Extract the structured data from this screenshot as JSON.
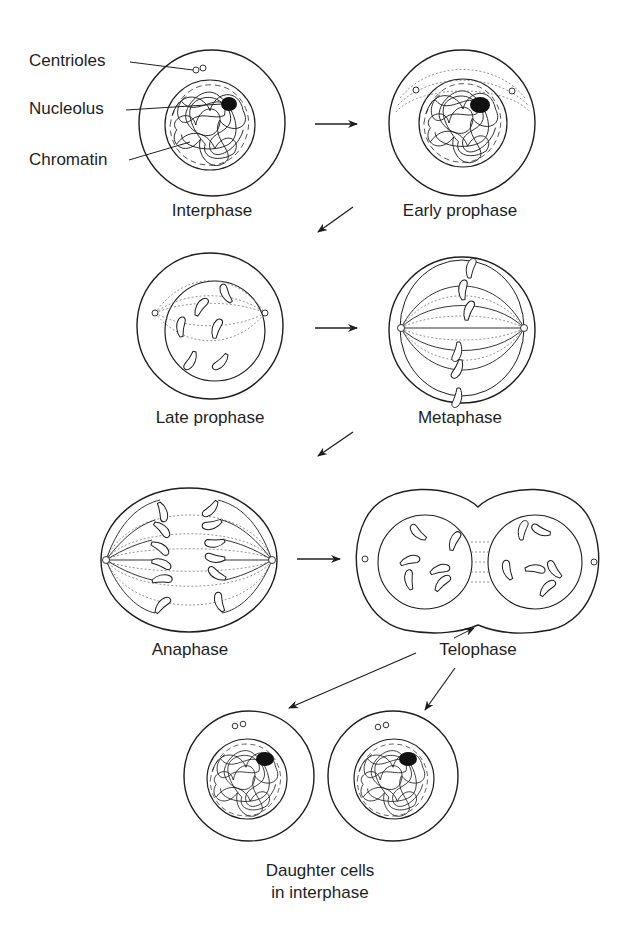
{
  "diagram": {
    "title": "",
    "stages": [
      {
        "id": "interphase",
        "label": "Interphase"
      },
      {
        "id": "early-prophase",
        "label": "Early prophase"
      },
      {
        "id": "late-prophase",
        "label": "Late prophase"
      },
      {
        "id": "metaphase",
        "label": "Metaphase"
      },
      {
        "id": "anaphase",
        "label": "Anaphase"
      },
      {
        "id": "telophase",
        "label": "Telophase"
      },
      {
        "id": "daughter-cells",
        "label_line1": "Daughter cells",
        "label_line2": "in interphase"
      }
    ],
    "callouts": [
      {
        "id": "centrioles",
        "label": "Centrioles"
      },
      {
        "id": "nucleolus",
        "label": "Nucleolus"
      },
      {
        "id": "chromatin",
        "label": "Chromatin"
      }
    ],
    "flow": [
      [
        "Interphase",
        "Early prophase"
      ],
      [
        "Early prophase",
        "Late prophase"
      ],
      [
        "Late prophase",
        "Metaphase"
      ],
      [
        "Metaphase",
        "Anaphase"
      ],
      [
        "Anaphase",
        "Telophase"
      ],
      [
        "Telophase",
        "Daughter cells in interphase"
      ]
    ],
    "colors": {
      "ink": "#1e1e1e",
      "background": "#ffffff",
      "dotted": "#777777"
    }
  }
}
